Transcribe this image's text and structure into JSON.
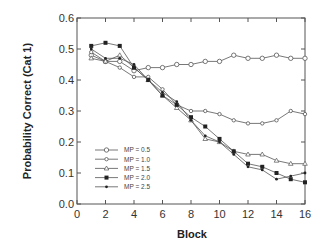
{
  "chart_data": {
    "type": "line",
    "title": "",
    "xlabel": "Block",
    "ylabel": "Probability Correct (Cat 1)",
    "xlim": [
      0,
      16
    ],
    "ylim": [
      0.0,
      0.6
    ],
    "x_ticks": [
      "0",
      "2",
      "4",
      "6",
      "8",
      "10",
      "12",
      "14",
      "16"
    ],
    "y_ticks": [
      "0.0",
      "0.1",
      "0.2",
      "0.3",
      "0.4",
      "0.5",
      "0.6"
    ],
    "grid": false,
    "legend_position": "lower-left inside",
    "x": [
      1,
      2,
      3,
      4,
      5,
      6,
      7,
      8,
      9,
      10,
      11,
      12,
      13,
      14,
      15,
      16
    ],
    "series": [
      {
        "name": "MP = 0.5",
        "marker": "open-circle",
        "values": [
          0.48,
          0.46,
          0.46,
          0.43,
          0.44,
          0.44,
          0.45,
          0.45,
          0.46,
          0.46,
          0.48,
          0.47,
          0.47,
          0.48,
          0.47,
          0.47
        ]
      },
      {
        "name": "MP = 1.0",
        "marker": "open-small",
        "values": [
          0.49,
          0.46,
          0.44,
          0.41,
          0.41,
          0.37,
          0.32,
          0.3,
          0.3,
          0.29,
          0.27,
          0.26,
          0.26,
          0.27,
          0.3,
          0.29
        ]
      },
      {
        "name": "MP = 1.5",
        "marker": "open-triangle",
        "values": [
          0.47,
          0.46,
          0.48,
          0.44,
          0.4,
          0.35,
          0.31,
          0.27,
          0.21,
          0.2,
          0.17,
          0.16,
          0.16,
          0.14,
          0.13,
          0.13
        ]
      },
      {
        "name": "MP = 2.0",
        "marker": "filled-square",
        "values": [
          0.51,
          0.52,
          0.51,
          0.44,
          0.4,
          0.35,
          0.32,
          0.28,
          0.25,
          0.21,
          0.17,
          0.13,
          0.12,
          0.1,
          0.08,
          0.07
        ]
      },
      {
        "name": "MP = 2.5",
        "marker": "filled-dot",
        "values": [
          0.5,
          0.47,
          0.47,
          0.45,
          0.4,
          0.36,
          0.33,
          0.27,
          0.22,
          0.2,
          0.16,
          0.12,
          0.11,
          0.08,
          0.09,
          0.1
        ]
      }
    ]
  },
  "colors": {
    "axis": "#555555",
    "line": "#555555",
    "marker_fill": "#222222"
  }
}
